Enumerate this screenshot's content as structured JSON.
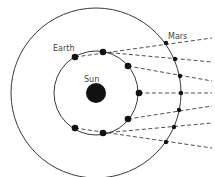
{
  "diagram": {
    "labels": {
      "sun": "Sun",
      "earth": "Earth",
      "mars": "Mars"
    },
    "colors": {
      "background": "#ffffff",
      "line": "#222222",
      "body": "#111111",
      "label": "#444444"
    },
    "sun": {
      "cx": 96,
      "cy": 93,
      "r": 10
    },
    "earth_orbit": {
      "cx": 96,
      "cy": 93,
      "r": 42
    },
    "mars_orbit": {
      "cx": 96,
      "cy": 93,
      "r": 85
    },
    "earth_positions": [
      {
        "x": 75,
        "y": 57
      },
      {
        "x": 103,
        "y": 52
      },
      {
        "x": 128,
        "y": 66
      },
      {
        "x": 139,
        "y": 93
      },
      {
        "x": 128,
        "y": 119
      },
      {
        "x": 103,
        "y": 133
      },
      {
        "x": 75,
        "y": 128
      }
    ],
    "mars_positions": [
      {
        "x": 166,
        "y": 43
      },
      {
        "x": 175,
        "y": 59
      },
      {
        "x": 180,
        "y": 76
      },
      {
        "x": 181,
        "y": 93
      },
      {
        "x": 179,
        "y": 110
      },
      {
        "x": 174,
        "y": 127
      },
      {
        "x": 166,
        "y": 142
      }
    ],
    "sightline_end_y": [
      38,
      62,
      81,
      93,
      106,
      123,
      148
    ],
    "sightline_end_x": 212
  }
}
